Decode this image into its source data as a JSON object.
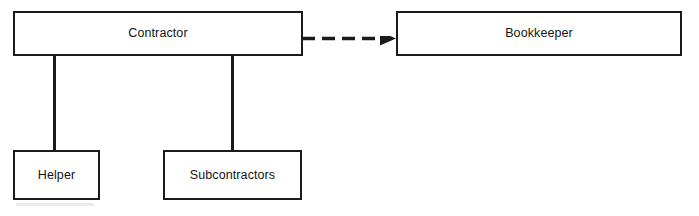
{
  "diagram": {
    "type": "class-diagram",
    "background_color": "#ffffff",
    "line_color": "#1b1b1b",
    "nodes": [
      {
        "id": "contractor",
        "label": "Contractor"
      },
      {
        "id": "bookkeeper",
        "label": "Bookkeeper"
      },
      {
        "id": "helper",
        "label": "Helper"
      },
      {
        "id": "subcontractors",
        "label": "Subcontractors"
      }
    ],
    "edges": [
      {
        "id": "contractor-helper",
        "from": "contractor",
        "to": "helper",
        "style": "solid",
        "arrow": "none"
      },
      {
        "id": "contractor-subcontractors",
        "from": "contractor",
        "to": "subcontractors",
        "style": "solid",
        "arrow": "none"
      },
      {
        "id": "contractor-bookkeeper",
        "from": "contractor",
        "to": "bookkeeper",
        "style": "dashed",
        "arrow": "filled-triangle",
        "dash_count": 4
      }
    ]
  }
}
